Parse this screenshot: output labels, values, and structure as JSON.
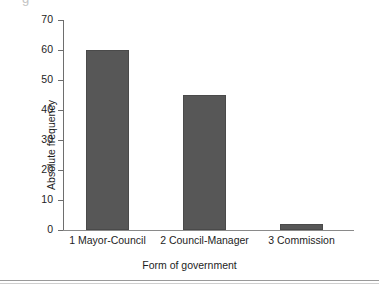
{
  "artifact": {
    "clipped_text": "g"
  },
  "chart_data": {
    "type": "bar",
    "title": "",
    "categories": [
      "1 Mayor-Council",
      "2 Council-Manager",
      "3 Commission"
    ],
    "values": [
      60,
      45,
      2
    ],
    "xlabel": "Form of government",
    "ylabel": "Absolute frequency",
    "ylim": [
      0,
      70
    ],
    "yticks": [
      0,
      10,
      20,
      30,
      40,
      50,
      60,
      70
    ],
    "ytick_labels": [
      "0",
      "10",
      "20",
      "30",
      "40",
      "50",
      "60",
      "70"
    ],
    "grid": false,
    "legend": null,
    "bar_color": "#575757",
    "axis_color": "#6e6e6e"
  }
}
